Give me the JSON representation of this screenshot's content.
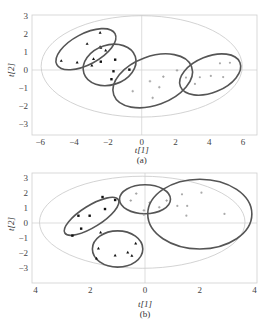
{
  "chart_data": [
    {
      "type": "scatter",
      "panel": "a",
      "caption": "(a)",
      "xlabel": "t[1]",
      "ylabel": "t[2]",
      "xlim": [
        -6.5,
        6.8
      ],
      "ylim": [
        -3.4,
        3.2
      ],
      "xticks": [
        -6,
        -4,
        -2,
        0,
        2,
        4,
        6
      ],
      "xtick_labels": [
        "-6",
        "-4",
        "-2",
        "0",
        "2",
        "4",
        "6"
      ],
      "yticks": [
        3,
        2,
        1,
        0,
        -1,
        -2,
        -3
      ],
      "ytick_labels": [
        "3",
        "2",
        "1",
        "0",
        "-1",
        "-2",
        "-3"
      ],
      "grid": false,
      "hotelling_ellipse": {
        "cx": 0,
        "cy": 0.2,
        "rx": 5.95,
        "ry": 2.8
      },
      "series": [
        {
          "name": "group 1",
          "marker": "triangle",
          "color": "#111111",
          "points": [
            [
              -4.76,
              0.51
            ],
            [
              -3.82,
              0.42
            ],
            [
              -3.23,
              1.45
            ],
            [
              -2.46,
              2.06
            ],
            [
              -2.46,
              1.28
            ],
            [
              -2.42,
              1.23
            ],
            [
              -2.85,
              0.62
            ],
            [
              -2.95,
              0.26
            ],
            [
              -2.13,
              1.08
            ]
          ],
          "ellipse": {
            "cx": -3.3,
            "cy": 1.15,
            "rx": 1.95,
            "ry": 0.85,
            "angle": -28
          }
        },
        {
          "name": "group 2",
          "marker": "square",
          "color": "#111111",
          "points": [
            [
              -2.42,
              0.46
            ],
            [
              -1.57,
              0.57
            ],
            [
              -1.67,
              -0.07
            ],
            [
              -1.79,
              -0.51
            ],
            [
              -0.73,
              0.02
            ]
          ],
          "ellipse": {
            "cx": -1.9,
            "cy": 0.28,
            "rx": 1.6,
            "ry": 1.1,
            "angle": -18
          }
        },
        {
          "name": "group 3",
          "marker": "cross",
          "color": "#999999",
          "points": [
            [
              -0.53,
              -1.17
            ],
            [
              0.49,
              -0.62
            ],
            [
              1.28,
              -0.37
            ],
            [
              1.04,
              -0.95
            ],
            [
              0.65,
              -1.54
            ],
            [
              2.09,
              -0.02
            ]
          ],
          "ellipse": {
            "cx": 0.65,
            "cy": -0.6,
            "rx": 2.45,
            "ry": 1.35,
            "angle": -20
          }
        },
        {
          "name": "group 4",
          "marker": "dot",
          "color": "#aaaaaa",
          "points": [
            [
              2.62,
              -0.42
            ],
            [
              3.15,
              -0.77
            ],
            [
              3.44,
              -0.4
            ],
            [
              4.09,
              -0.33
            ],
            [
              4.82,
              -0.39
            ],
            [
              4.63,
              0.37
            ],
            [
              5.22,
              0.4
            ]
          ],
          "ellipse": {
            "cx": 4.05,
            "cy": -0.25,
            "rx": 1.9,
            "ry": 1.0,
            "angle": -22
          }
        }
      ]
    },
    {
      "type": "scatter",
      "panel": "b",
      "caption": "(b)",
      "xlabel": "t[1]",
      "ylabel": "t[2]",
      "xlim": [
        -4,
        4
      ],
      "ylim": [
        -4,
        3.4
      ],
      "xticks": [
        -4,
        -2,
        0,
        2,
        4
      ],
      "xtick_labels": [
        "4",
        "2",
        "0",
        "2",
        "4"
      ],
      "yticks": [
        3,
        2,
        1,
        0,
        -1,
        -2,
        -3
      ],
      "ytick_labels": [
        "3",
        "2",
        "1",
        "0",
        "-1",
        "-2",
        "-3"
      ],
      "grid": false,
      "hotelling_ellipse": {
        "cx": -0.1,
        "cy": 0.05,
        "rx": 3.75,
        "ry": 3.1
      },
      "series": [
        {
          "name": "group 1",
          "marker": "square",
          "color": "#111111",
          "points": [
            [
              -1.55,
              1.75
            ],
            [
              -1.09,
              1.55
            ],
            [
              -1.46,
              0.94
            ],
            [
              -2.43,
              0.49
            ],
            [
              -2.02,
              0.49
            ],
            [
              -2.33,
              -0.38
            ],
            [
              -2.65,
              -0.85
            ]
          ],
          "ellipse": {
            "cx": -1.95,
            "cy": 0.45,
            "rx": 1.15,
            "ry": 0.72,
            "angle": -32
          }
        },
        {
          "name": "group 2",
          "marker": "triangle",
          "color": "#111111",
          "points": [
            [
              -1.62,
              -0.63
            ],
            [
              -1.7,
              -1.71
            ],
            [
              -1.77,
              -2.38
            ],
            [
              -1.09,
              -2.18
            ],
            [
              -0.63,
              -1.98
            ],
            [
              -0.48,
              -2.2
            ],
            [
              -0.34,
              -1.37
            ]
          ],
          "ellipse": {
            "cx": -1.0,
            "cy": -1.75,
            "rx": 0.92,
            "ry": 1.22,
            "angle": 0
          }
        },
        {
          "name": "group 3",
          "marker": "cross",
          "color": "#999999",
          "points": [
            [
              -0.52,
              1.51
            ],
            [
              -0.32,
              1.98
            ],
            [
              -0.04,
              0.85
            ],
            [
              -0.04,
              0.56
            ],
            [
              0.17,
              1.37
            ],
            [
              0.52,
              1.06
            ],
            [
              0.79,
              1.51
            ]
          ],
          "ellipse": {
            "cx": 0.0,
            "cy": 1.6,
            "rx": 0.93,
            "ry": 0.98,
            "angle": 0
          }
        },
        {
          "name": "group 4",
          "marker": "dot",
          "color": "#aaaaaa",
          "points": [
            [
              1.35,
              1.93
            ],
            [
              2.06,
              2.04
            ],
            [
              1.18,
              1.15
            ],
            [
              1.54,
              1.15
            ],
            [
              1.51,
              0.49
            ],
            [
              2.9,
              0.61
            ]
          ],
          "ellipse": {
            "cx": 2.0,
            "cy": 0.6,
            "rx": 1.9,
            "ry": 2.35,
            "angle": 0
          }
        }
      ]
    }
  ],
  "labels": {
    "a": {
      "xlabel": "t[1]",
      "ylabel": "t[2]",
      "caption": "(a)"
    },
    "b": {
      "xlabel": "t[1]",
      "ylabel": "t[2]",
      "caption": "(b)"
    }
  }
}
